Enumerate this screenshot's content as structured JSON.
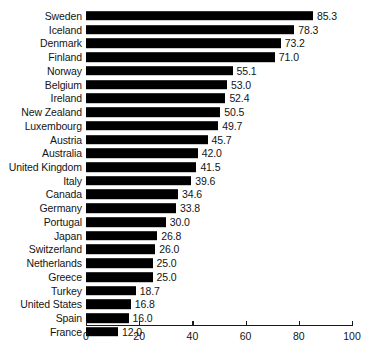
{
  "chart_data": {
    "type": "bar",
    "orientation": "horizontal",
    "title": "",
    "subtitle": "",
    "xlabel": "",
    "ylabel": "",
    "xlim": [
      0,
      100
    ],
    "xticks": [
      "0",
      "20",
      "40",
      "60",
      "80",
      "100"
    ],
    "grid": false,
    "legend": false,
    "bar_color": "#000000",
    "text_color": "#141414",
    "background": "#ffffff",
    "sorted": "descending",
    "value_labels_shown": true,
    "categories": [
      "Sweden",
      "Iceland",
      "Denmark",
      "Finland",
      "Norway",
      "Belgium",
      "Ireland",
      "New Zealand",
      "Luxembourg",
      "Austria",
      "Australia",
      "United Kingdom",
      "Italy",
      "Canada",
      "Germany",
      "Portugal",
      "Japan",
      "Switzerland",
      "Netherlands",
      "Greece",
      "Turkey",
      "United States",
      "Spain",
      "France"
    ],
    "values": [
      85.3,
      78.3,
      73.2,
      71.0,
      55.1,
      53.0,
      52.4,
      50.5,
      49.7,
      45.7,
      42.0,
      41.5,
      39.6,
      34.6,
      33.8,
      30.0,
      26.8,
      26.0,
      25.0,
      25.0,
      18.7,
      16.8,
      16.0,
      12.0
    ],
    "value_labels": [
      "85.3",
      "78.3",
      "73.2",
      "71.0",
      "55.1",
      "53.0",
      "52.4",
      "50.5",
      "49.7",
      "45.7",
      "42.0",
      "41.5",
      "39.6",
      "34.6",
      "33.8",
      "30.0",
      "26.8",
      "26.0",
      "25.0",
      "25.0",
      "18.7",
      "16.8",
      "16.0",
      "12.0"
    ]
  }
}
